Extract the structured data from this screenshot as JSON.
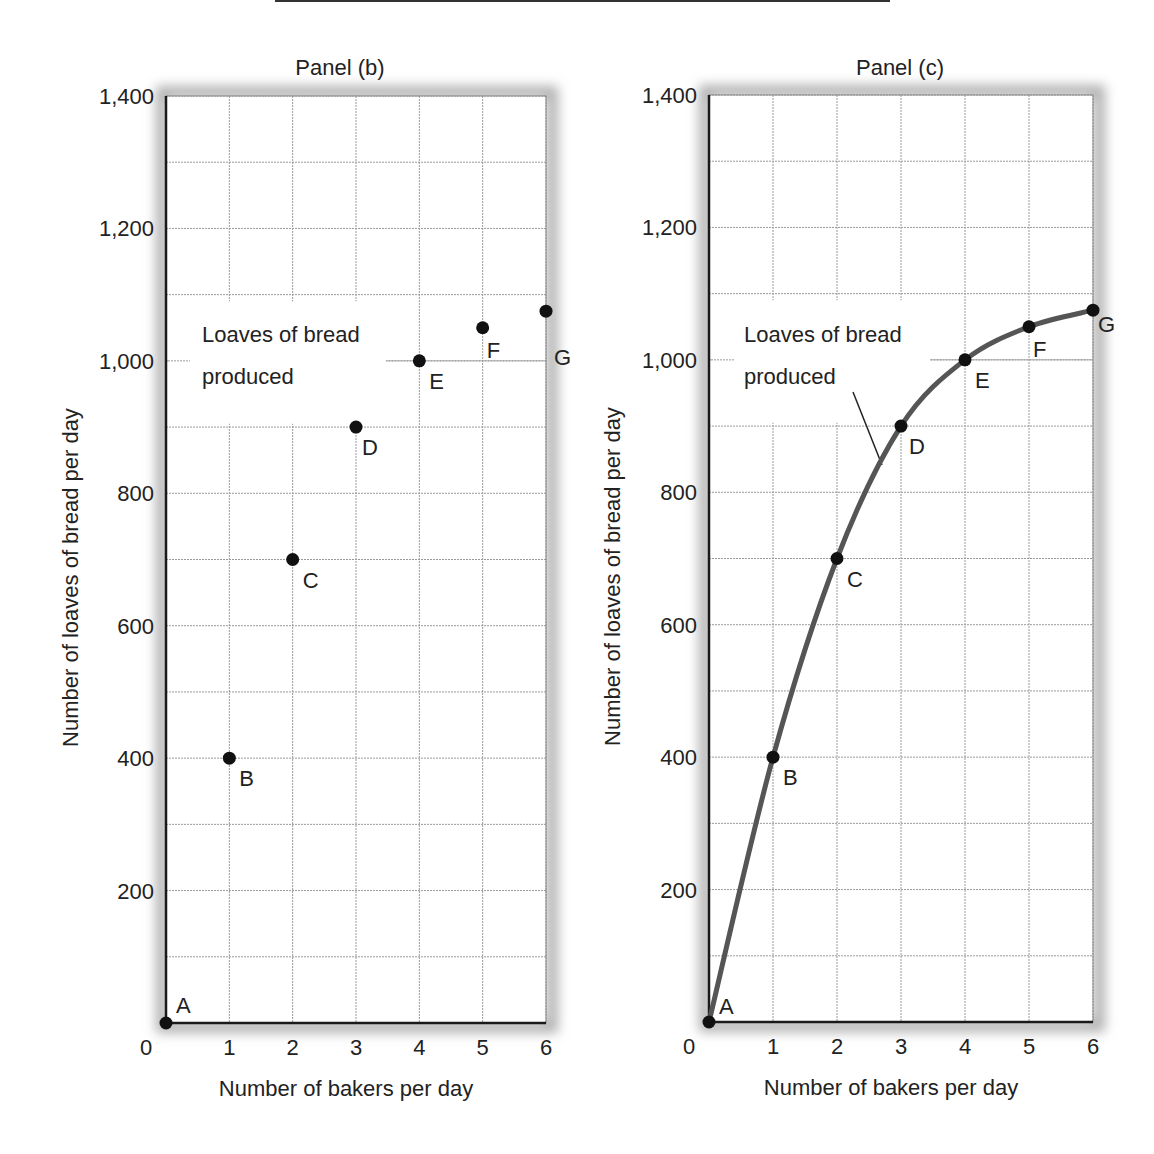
{
  "chart_data": [
    {
      "type": "scatter",
      "title": "Panel (b)",
      "xlabel": "Number of bakers per day",
      "ylabel": "Number of loaves of bread per day",
      "xlim": [
        0,
        6
      ],
      "ylim": [
        0,
        1400
      ],
      "x_ticks": [
        "0",
        "1",
        "2",
        "3",
        "4",
        "5",
        "6"
      ],
      "y_ticks": [
        "200",
        "400",
        "600",
        "800",
        "1,000",
        "1,200",
        "1,400"
      ],
      "grid": true,
      "grid_y_step": 100,
      "annotation": "Loaves of bread produced",
      "points": [
        {
          "label": "A",
          "x": 0,
          "y": 0
        },
        {
          "label": "B",
          "x": 1,
          "y": 400
        },
        {
          "label": "C",
          "x": 2,
          "y": 700
        },
        {
          "label": "D",
          "x": 3,
          "y": 900
        },
        {
          "label": "E",
          "x": 4,
          "y": 1000
        },
        {
          "label": "F",
          "x": 5,
          "y": 1050
        },
        {
          "label": "G",
          "x": 6,
          "y": 1075
        }
      ]
    },
    {
      "type": "line",
      "title": "Panel (c)",
      "xlabel": "Number of bakers per day",
      "ylabel": "Number of loaves of bread per day",
      "xlim": [
        0,
        6
      ],
      "ylim": [
        0,
        1400
      ],
      "x_ticks": [
        "0",
        "1",
        "2",
        "3",
        "4",
        "5",
        "6"
      ],
      "y_ticks": [
        "200",
        "400",
        "600",
        "800",
        "1,000",
        "1,200",
        "1,400"
      ],
      "grid": true,
      "grid_y_step": 100,
      "annotation": "Loaves of bread produced",
      "series": [
        {
          "name": "Loaves of bread produced",
          "x": [
            0,
            1,
            2,
            3,
            4,
            5,
            6
          ],
          "values": [
            0,
            400,
            700,
            900,
            1000,
            1050,
            1075
          ]
        }
      ],
      "points": [
        {
          "label": "A",
          "x": 0,
          "y": 0
        },
        {
          "label": "B",
          "x": 1,
          "y": 400
        },
        {
          "label": "C",
          "x": 2,
          "y": 700
        },
        {
          "label": "D",
          "x": 3,
          "y": 900
        },
        {
          "label": "E",
          "x": 4,
          "y": 1000
        },
        {
          "label": "F",
          "x": 5,
          "y": 1050
        },
        {
          "label": "G",
          "x": 6,
          "y": 1075
        }
      ]
    }
  ],
  "panels": {
    "b": {
      "title": "Panel (b)",
      "xlabel": "Number of bakers per day",
      "ylabel": "Number of loaves of bread per day",
      "annotation_line1": "Loaves of bread",
      "annotation_line2": "produced",
      "origin_label": "0"
    },
    "c": {
      "title": "Panel (c)",
      "xlabel": "Number of bakers per day",
      "ylabel": "Number of loaves of bread per day",
      "annotation_line1": "Loaves of bread",
      "annotation_line2": "produced",
      "origin_label": "0"
    }
  },
  "colors": {
    "axis": "#1a1a1a",
    "grid": "#9a9a9a",
    "curve": "#555555",
    "point": "#111111",
    "shadow": "#b0b0b0"
  }
}
